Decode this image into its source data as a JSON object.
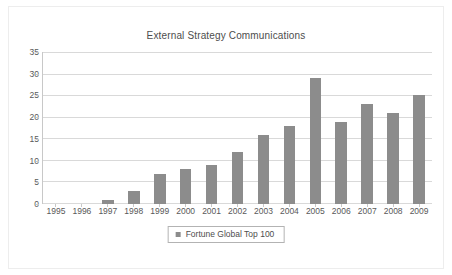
{
  "figure": {
    "border_color": "#ededed",
    "background": "#ffffff"
  },
  "chart_data": {
    "type": "bar",
    "title": "External Strategy Communications",
    "xlabel": "",
    "ylabel": "",
    "categories": [
      "1995",
      "1996",
      "1997",
      "1998",
      "1999",
      "2000",
      "2001",
      "2002",
      "2003",
      "2004",
      "2005",
      "2006",
      "2007",
      "2008",
      "2009"
    ],
    "values": [
      0,
      0,
      1,
      3,
      7,
      8,
      9,
      12,
      16,
      18,
      29,
      19,
      23,
      21,
      25
    ],
    "series": [
      {
        "name": "Fortune Global Top 100",
        "color": "#8c8c8c",
        "values": [
          0,
          0,
          1,
          3,
          7,
          8,
          9,
          12,
          16,
          18,
          29,
          19,
          23,
          21,
          25
        ]
      }
    ],
    "ylim": [
      0,
      35
    ],
    "yticks": [
      0,
      5,
      10,
      15,
      20,
      25,
      30,
      35
    ],
    "ytick_labels": [
      "0",
      "5",
      "10",
      "15",
      "20",
      "25",
      "30",
      "35"
    ],
    "grid": true,
    "grid_axis": "y",
    "grid_color": "#d9d9d9",
    "axis_color": "#c8c8c8",
    "legend_position": "bottom-center"
  },
  "legend": {
    "marker": "square-marker",
    "label": "Fortune Global Top 100",
    "color": "#8c8c8c"
  }
}
